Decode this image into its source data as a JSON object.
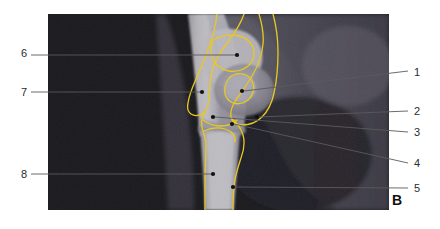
{
  "figure": {
    "panel_letter": "B",
    "modality": "mri-sagittal-knee-scan",
    "image_region": {
      "x": 48,
      "y": 14,
      "width": 341,
      "height": 196
    },
    "background_color": "#ffffff",
    "scan_background_color": "#050505",
    "contour_color": "#e8c823",
    "leader_color": "#5a5a5a",
    "label_color": "#2b2b2b"
  },
  "labels": [
    {
      "id": "1",
      "text": "1",
      "side": "right",
      "label_x": 414,
      "label_y": 73,
      "leader": {
        "x1": 408,
        "y1": 71,
        "x2": 244,
        "y2": 91
      },
      "dot": {
        "x": 242,
        "y": 91
      }
    },
    {
      "id": "2",
      "text": "2",
      "side": "right",
      "label_x": 414,
      "label_y": 112,
      "leader": {
        "x1": 408,
        "y1": 111,
        "x2": 259,
        "y2": 117
      },
      "dot": {
        "x": 257,
        "y": 117
      }
    },
    {
      "id": "3",
      "text": "3",
      "side": "right",
      "label_x": 414,
      "label_y": 133,
      "leader": {
        "x1": 408,
        "y1": 132,
        "x2": 215,
        "y2": 117
      },
      "dot": {
        "x": 213,
        "y": 117
      }
    },
    {
      "id": "4",
      "text": "4",
      "side": "right",
      "label_x": 414,
      "label_y": 164,
      "leader": {
        "x1": 408,
        "y1": 163,
        "x2": 234,
        "y2": 124
      },
      "dot": {
        "x": 232,
        "y": 124
      }
    },
    {
      "id": "5",
      "text": "5",
      "side": "right",
      "label_x": 414,
      "label_y": 189,
      "leader": {
        "x1": 408,
        "y1": 188,
        "x2": 235,
        "y2": 187
      },
      "dot": {
        "x": 233,
        "y": 187
      }
    },
    {
      "id": "6",
      "text": "6",
      "side": "left",
      "label_x": 21,
      "label_y": 54,
      "leader": {
        "x1": 31,
        "y1": 55,
        "x2": 235,
        "y2": 55
      },
      "dot": {
        "x": 237,
        "y": 55
      }
    },
    {
      "id": "7",
      "text": "7",
      "side": "left",
      "label_x": 21,
      "label_y": 93,
      "leader": {
        "x1": 31,
        "y1": 92,
        "x2": 200,
        "y2": 92
      },
      "dot": {
        "x": 202,
        "y": 92
      }
    },
    {
      "id": "8",
      "text": "8",
      "side": "left",
      "label_x": 21,
      "label_y": 175,
      "leader": {
        "x1": 31,
        "y1": 174,
        "x2": 211,
        "y2": 174
      },
      "dot": {
        "x": 213,
        "y": 174
      }
    }
  ],
  "contours": [
    {
      "name": "distal-femur-outer-contour",
      "path": "M 244 14 C 240 26, 234 34, 228 42 C 220 52, 214 62, 212 72 C 210 82, 209 92, 209 100 C 208 108, 205 112, 202 114 C 198 116, 194 116, 191 114 C 188 112, 187 108, 188 103 C 189 96, 192 88, 196 79 C 201 68, 206 56, 210 44 C 214 33, 216 22, 217 14"
    },
    {
      "name": "femoral-condyle-contour",
      "path": "M 259 14 C 262 24, 264 34, 263 44 C 262 56, 258 66, 252 76 C 247 85, 241 93, 236 100 C 232 106, 230 112, 231 117 C 232 122, 236 125, 242 125 C 250 125, 257 122, 262 117 C 268 111, 272 103, 274 93 C 277 80, 278 66, 278 52 C 278 38, 276 25, 273 14"
    },
    {
      "name": "patella-contour",
      "path": "M 236 74 C 230 76, 226 81, 225 87 C 224 93, 226 99, 231 102 C 236 105, 243 104, 248 100 C 253 96, 255 89, 253 83 C 251 77, 244 72, 236 74 Z"
    },
    {
      "name": "proximal-tibia-contour",
      "path": "M 205 113 C 202 116, 201 121, 202 127 C 203 133, 206 138, 206 145 C 206 156, 205 170, 205 182 C 205 194, 205 203, 205 210"
    },
    {
      "name": "tibia-lateral-contour",
      "path": "M 231 118 C 236 122, 241 128, 243 135 C 245 142, 244 150, 241 158 C 238 167, 235 176, 234 186 C 233 195, 233 203, 233 210"
    },
    {
      "name": "tibial-plateau-contour",
      "path": "M 203 120 C 208 124, 214 126, 221 126 C 227 126, 233 124, 237 120"
    },
    {
      "name": "growth-plate-upper-contour",
      "path": "M 213 40 C 220 36, 230 34, 239 36 C 248 38, 254 45, 254 53 C 254 61, 249 67, 241 70 C 233 73, 224 71, 218 66 C 212 61, 209 51, 213 40 Z"
    },
    {
      "name": "tibial-growth-plate-contour",
      "path": "M 204 131 C 210 128, 218 127, 225 129 C 232 131, 236 136, 235 142"
    }
  ]
}
